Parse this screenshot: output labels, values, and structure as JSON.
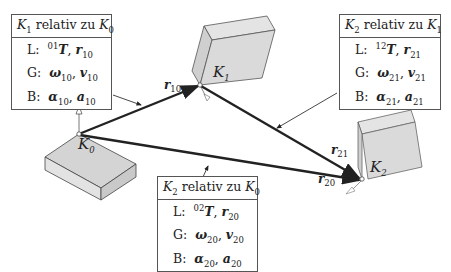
{
  "frames": {
    "k0": {
      "label": "K",
      "sub": "0"
    },
    "k1": {
      "label": "K",
      "sub": "1"
    },
    "k2": {
      "label": "K",
      "sub": "2"
    }
  },
  "vectors": {
    "r10": {
      "sym": "r",
      "sub": "10"
    },
    "r21": {
      "sym": "r",
      "sub": "21"
    },
    "r20": {
      "sym": "r",
      "sub": "20"
    }
  },
  "boxes": {
    "k1_k0": {
      "title": {
        "a": "K",
        "a_sub": "1",
        "mid": " relativ zu ",
        "b": "K",
        "b_sub": "0"
      },
      "rows": [
        {
          "key": "L:",
          "sup": "01",
          "v1": "T",
          "sep": ", ",
          "v2": "r",
          "v2_sub": "10"
        },
        {
          "key": "G:",
          "v1": "ω",
          "v1_sub": "10",
          "sep": ", ",
          "v2": "v",
          "v2_sub": "10"
        },
        {
          "key": "B:",
          "v1": "α",
          "v1_sub": "10",
          "sep": ", ",
          "v2": "a",
          "v2_sub": "10"
        }
      ]
    },
    "k2_k1": {
      "title": {
        "a": "K",
        "a_sub": "2",
        "mid": " relativ zu ",
        "b": "K",
        "b_sub": "1"
      },
      "rows": [
        {
          "key": "L:",
          "sup": "12",
          "v1": "T",
          "sep": ", ",
          "v2": "r",
          "v2_sub": "21"
        },
        {
          "key": "G:",
          "v1": "ω",
          "v1_sub": "21",
          "sep": ", ",
          "v2": "v",
          "v2_sub": "21"
        },
        {
          "key": "B:",
          "v1": "α",
          "v1_sub": "21",
          "sep": ", ",
          "v2": "a",
          "v2_sub": "21"
        }
      ]
    },
    "k2_k0": {
      "title": {
        "a": "K",
        "a_sub": "2",
        "mid": " relativ zu ",
        "b": "K",
        "b_sub": "0"
      },
      "rows": [
        {
          "key": "L:",
          "sup": "02",
          "v1": "T",
          "sep": ", ",
          "v2": "r",
          "v2_sub": "20"
        },
        {
          "key": "G:",
          "v1": "ω",
          "v1_sub": "20",
          "sep": ", ",
          "v2": "v",
          "v2_sub": "20"
        },
        {
          "key": "B:",
          "v1": "α",
          "v1_sub": "20",
          "sep": ", ",
          "v2": "a",
          "v2_sub": "20"
        }
      ]
    }
  },
  "colors": {
    "body_fill": "#d9d9d9",
    "body_side": "#cccccc",
    "line": "#222222"
  }
}
